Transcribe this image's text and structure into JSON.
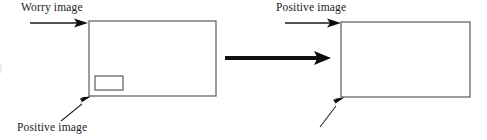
{
  "figure": {
    "type": "diagram",
    "background_color": "#ffffff",
    "width": 487,
    "height": 140,
    "labels": {
      "worry_image": "Worry image",
      "positive_image_left": "Positive image",
      "positive_image_right": "Positive image"
    },
    "colors": {
      "text": "#1a1a1a",
      "box_stroke": "#5a5a5a",
      "thin_arrow": "#1a1a1a",
      "thick_arrow": "#111111"
    },
    "boxes": [
      {
        "name": "left-outer-box",
        "x": 89,
        "y": 21,
        "width": 127,
        "height": 75,
        "fill": "none",
        "stroke": "#5a5a5a",
        "stroke_width": 1.2
      },
      {
        "name": "left-inner-box",
        "x": 95,
        "y": 76,
        "width": 28,
        "height": 14,
        "fill": "none",
        "stroke": "#5a5a5a",
        "stroke_width": 1.2
      },
      {
        "name": "right-outer-box",
        "x": 341,
        "y": 22,
        "width": 129,
        "height": 75,
        "fill": "none",
        "stroke": "#5a5a5a",
        "stroke_width": 1.2
      }
    ],
    "arrows": [
      {
        "name": "worry-image-arrow",
        "style": "thin",
        "x1": 30,
        "y1": 23,
        "x2": 88,
        "y2": 23,
        "stroke_width": 1.3,
        "head_length": 11,
        "head_width": 8
      },
      {
        "name": "positive-image-left-arrow",
        "style": "thin",
        "x1": 61,
        "y1": 121,
        "x2": 90,
        "y2": 97,
        "stroke_width": 1.1,
        "head_length": 12,
        "head_width": 8
      },
      {
        "name": "transition-arrow",
        "style": "thick",
        "x1": 225,
        "y1": 58,
        "x2": 331,
        "y2": 58,
        "stroke_width": 4.2,
        "head_length": 14,
        "head_width": 13
      },
      {
        "name": "positive-image-right-arrow",
        "style": "thin",
        "x1": 285,
        "y1": 23,
        "x2": 341,
        "y2": 23,
        "stroke_width": 1.3,
        "head_length": 11,
        "head_width": 8
      },
      {
        "name": "positive-image-bottom-right-arrow",
        "style": "thin",
        "x1": 320,
        "y1": 127,
        "x2": 344,
        "y2": 98,
        "stroke_width": 1.1,
        "head_length": 12,
        "head_width": 8
      }
    ]
  }
}
